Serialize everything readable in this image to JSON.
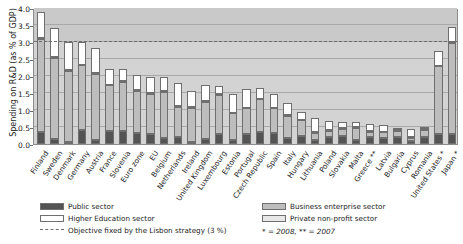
{
  "chart_data": {
    "type": "bar",
    "stacked": true,
    "title": "",
    "xlabel": "",
    "ylabel": "Spending on R&D (as % of GDP)",
    "ylim": [
      0.0,
      4.0
    ],
    "ytick_labels": [
      "0.0",
      "0.5",
      "1.0",
      "1.5",
      "2.0",
      "2.5",
      "3.0",
      "3.5",
      "4.0"
    ],
    "ytick_values": [
      0.0,
      0.5,
      1.0,
      1.5,
      2.0,
      2.5,
      3.0,
      3.5,
      4.0
    ],
    "grid": true,
    "legend_position": "below",
    "categories": [
      "Finland",
      "Sweden",
      "Denmark",
      "Germany",
      "Austria",
      "France",
      "Slovenia",
      "Euro zone",
      "EU",
      "Belgium",
      "Netherlands",
      "Ireland",
      "United Kingdom",
      "Luxembourg",
      "Estonia",
      "Portugal",
      "Czech Republic",
      "Spain",
      "Italy",
      "Hungary",
      "Lithuania",
      "Poland",
      "Slovakia",
      "Malta",
      "Greece **",
      "Latvia",
      "Bulgaria",
      "Cyprus",
      "Romania",
      "United States *",
      "Japan *"
    ],
    "series": [
      {
        "name": "Public sector",
        "color": "#545454",
        "values": [
          0.35,
          0.14,
          0.06,
          0.41,
          0.12,
          0.38,
          0.38,
          0.31,
          0.28,
          0.18,
          0.22,
          0.06,
          0.15,
          0.3,
          0.13,
          0.3,
          0.36,
          0.33,
          0.17,
          0.24,
          0.12,
          0.21,
          0.25,
          0.11,
          0.21,
          0.19,
          0.22,
          0.08,
          0.22,
          0.28,
          0.28
        ]
      },
      {
        "name": "Business enterprise sector",
        "color": "#bdbdbd",
        "values": [
          2.75,
          2.4,
          2.1,
          1.9,
          1.95,
          1.35,
          1.45,
          1.25,
          1.2,
          1.35,
          0.88,
          1.0,
          1.1,
          1.15,
          0.77,
          0.75,
          0.95,
          0.72,
          0.65,
          0.46,
          0.2,
          0.18,
          0.2,
          0.37,
          0.15,
          0.15,
          0.16,
          0.11,
          0.19,
          2.0,
          2.7
        ]
      },
      {
        "name": "Higher Education sector",
        "color": "#ffffff",
        "values": [
          0.75,
          0.85,
          0.83,
          0.67,
          0.72,
          0.47,
          0.37,
          0.46,
          0.48,
          0.43,
          0.68,
          0.48,
          0.46,
          0.25,
          0.56,
          0.56,
          0.31,
          0.39,
          0.36,
          0.21,
          0.42,
          0.26,
          0.17,
          0.15,
          0.22,
          0.21,
          0.05,
          0.22,
          0.05,
          0.44,
          0.45
        ]
      },
      {
        "name": "Private non-profit sector",
        "color": "#e8e8e8",
        "values": [
          0.02,
          0.02,
          0.02,
          0.02,
          0.02,
          0.02,
          0.02,
          0.02,
          0.02,
          0.02,
          0.02,
          0.02,
          0.02,
          0.02,
          0.02,
          0.02,
          0.02,
          0.02,
          0.02,
          0.02,
          0.02,
          0.02,
          0.02,
          0.02,
          0.02,
          0.02,
          0.02,
          0.02,
          0.02,
          0.02,
          0.02
        ]
      }
    ],
    "totals": [
      3.87,
      3.41,
      3.01,
      3.0,
      2.81,
      2.22,
      2.22,
      2.04,
      1.98,
      1.98,
      1.8,
      1.56,
      1.73,
      1.72,
      1.48,
      1.63,
      1.64,
      1.46,
      1.2,
      0.93,
      0.76,
      0.67,
      0.64,
      0.65,
      0.6,
      0.57,
      0.45,
      0.43,
      0.48,
      2.74,
      3.45
    ],
    "reference_lines": [
      {
        "label": "Objective fixed by the Lisbon strategy (3 %)",
        "value": 3.0,
        "style": "dashed",
        "color": "#6e6e6e"
      }
    ],
    "annotations": {
      "footnote": "* = 2008,  ** = 2007"
    }
  },
  "legend": {
    "items": [
      {
        "label": "Public sector",
        "swatch": "sw-public",
        "icon": "legend-swatch-icon"
      },
      {
        "label": "Higher Education sector",
        "swatch": "sw-higher",
        "icon": "legend-swatch-icon"
      },
      {
        "label": "Business enterprise sector",
        "swatch": "sw-business",
        "icon": "legend-swatch-icon"
      },
      {
        "label": "Private non-profit sector",
        "swatch": "sw-private",
        "icon": "legend-swatch-icon"
      },
      {
        "label": "Objective fixed by the Lisbon strategy (3 %)",
        "swatch": "dash",
        "icon": "dashed-line-icon"
      }
    ],
    "footnote": "* = 2008,  ** = 2007"
  },
  "colors": {
    "public": "#545454",
    "business": "#bdbdbd",
    "higher_education": "#ffffff",
    "private_non_profit": "#e8e8e8",
    "plot_background": "#d3d3d3",
    "gridline": "#a8a8a8",
    "reference_line": "#6e6e6e",
    "text": "#1a1a1a"
  }
}
